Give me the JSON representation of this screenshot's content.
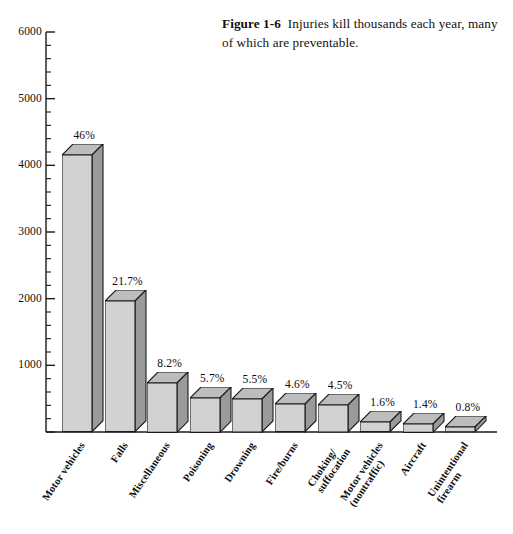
{
  "caption": {
    "figure_label": "Figure 1-6",
    "text": "Injuries kill thousands each year, many of which are preventable."
  },
  "chart_data": {
    "type": "bar",
    "title": "",
    "xlabel": "",
    "ylabel": "",
    "ylim": [
      0,
      6000
    ],
    "ytick_values": [
      0,
      1000,
      2000,
      3000,
      4000,
      5000,
      6000
    ],
    "ytick_labels": [
      "",
      "1000",
      "2000",
      "3000",
      "4000",
      "5000",
      "6000"
    ],
    "minor_tick_interval": 200,
    "grid": false,
    "legend": "none",
    "style": "3d-bar",
    "categories": [
      "Motor vehicles",
      "Falls",
      "Miscellaneous",
      "Poisoning",
      "Drowning",
      "Fire/burns",
      "Choking/\nsuffocation",
      "Motor vehicles\n(nontraffic)",
      "Aircraft",
      "Unintentional\nfirearm"
    ],
    "values": [
      4150,
      1960,
      740,
      515,
      495,
      415,
      405,
      145,
      125,
      72
    ],
    "data_labels": [
      "46%",
      "21.7%",
      "8.2%",
      "5.7%",
      "5.5%",
      "4.6%",
      "4.5%",
      "1.6%",
      "1.4%",
      "0.8%"
    ]
  },
  "colors": {
    "bar_front": "#d2d2d2",
    "bar_side": "#9a9a9a",
    "bar_top": "#bdbdbd",
    "outline": "#1a1a1a",
    "axis": "#1a1a1a",
    "background": "#ffffff"
  }
}
